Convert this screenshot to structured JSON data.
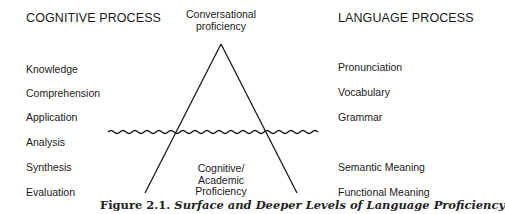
{
  "left_column": {
    "header": "COGNITIVE PROCESS",
    "items": [
      "Knowledge",
      "Comprehension",
      "Application",
      "Analysis",
      "Synthesis",
      "Evaluation"
    ]
  },
  "right_column": {
    "header": "LANGUAGE PROCESS",
    "items": [
      "Pronunciation",
      "Vocabulary",
      "Grammar",
      "Semantic Meaning",
      "Functional Meaning"
    ]
  },
  "triangle": {
    "top_label_line1": "Conversational",
    "top_label_line2": "proficiency",
    "bottom_label_line1": "Cognitive/",
    "bottom_label_line2": "Academic",
    "bottom_label_line3": "Proficiency"
  },
  "caption": {
    "number": "Figure 2.1.",
    "title": "Surface and Deeper Levels of Language Proficiency"
  }
}
